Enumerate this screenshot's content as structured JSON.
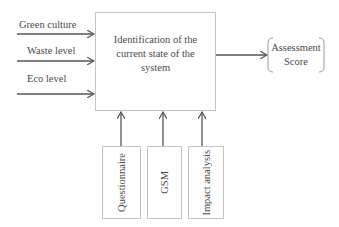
{
  "diagram": {
    "inputs": [
      {
        "label": "Green culture"
      },
      {
        "label": "Waste level"
      },
      {
        "label": "Eco level"
      }
    ],
    "process": {
      "label": "Identification of the current state of the system"
    },
    "output": {
      "label_line1": "Assessment",
      "label_line2": "Score"
    },
    "methods": [
      {
        "label": "Questionnaire"
      },
      {
        "label": "GSM"
      },
      {
        "label": "Impact analysis"
      }
    ],
    "colors": {
      "line": "#555555",
      "box_border": "#c4c4c4",
      "text": "#4a4a4a"
    }
  }
}
